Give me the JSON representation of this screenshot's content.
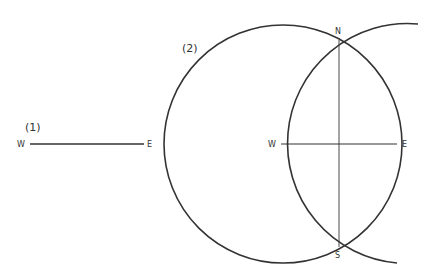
{
  "steps": {
    "one": "(1)",
    "two": "(2)"
  },
  "points": {
    "W": "W",
    "E": "E",
    "N": "N",
    "S": "S"
  },
  "colors": {
    "stroke": "#333333"
  }
}
